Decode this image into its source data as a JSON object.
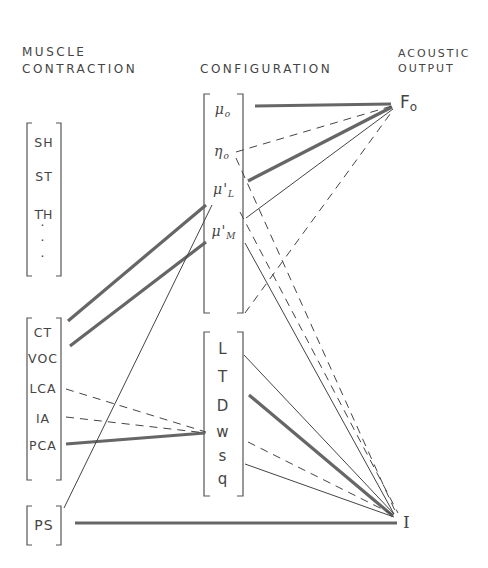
{
  "headers": {
    "muscle": [
      "MUSCLE",
      "CONTRACTION"
    ],
    "config": "CONFIGURATION",
    "acoustic": [
      "ACOUSTIC",
      "OUTPUT"
    ]
  },
  "muscle_group_1": [
    "SH",
    "ST",
    "TH",
    "·",
    "·",
    "·",
    "·"
  ],
  "muscle_group_2": [
    "CT",
    "VOC",
    "LCA",
    "IA",
    "PCA"
  ],
  "muscle_group_3": [
    "PS"
  ],
  "config_group_1": {
    "mu0": "μ",
    "mu0_sub": "o",
    "eta0": "η",
    "eta0_sub": "o",
    "muL": "μ'",
    "muL_sub": "L",
    "muM": "μ'",
    "muM_sub": "M"
  },
  "config_group_2": [
    "L",
    "T",
    "D",
    "w",
    "s",
    "q"
  ],
  "outputs": {
    "f0": "F",
    "f0_sub": "o",
    "intensity": "I"
  },
  "connections": [
    {
      "from": "CT",
      "to": "μ'L",
      "style": "double"
    },
    {
      "from": "VOC",
      "to": "μ'M",
      "style": "double"
    },
    {
      "from": "LCA",
      "to": "w",
      "style": "dashed"
    },
    {
      "from": "IA",
      "to": "w",
      "style": "dashed"
    },
    {
      "from": "PCA",
      "to": "w",
      "style": "double"
    },
    {
      "from": "PS",
      "to": "μ'L",
      "style": "solid"
    },
    {
      "from": "PS",
      "to": "I",
      "style": "double"
    },
    {
      "from": "μo",
      "to": "Fo",
      "style": "double"
    },
    {
      "from": "ηo",
      "to": "Fo",
      "style": "dashed"
    },
    {
      "from": "μ'L",
      "to": "Fo",
      "style": "double"
    },
    {
      "from": "μ'M",
      "to": "Fo",
      "style": "solid"
    },
    {
      "from": "L",
      "to": "Fo",
      "style": "dashed"
    },
    {
      "from": "ηo",
      "to": "I",
      "style": "dashed"
    },
    {
      "from": "μ'L",
      "to": "I",
      "style": "dashed"
    },
    {
      "from": "μ'M",
      "to": "I",
      "style": "solid"
    },
    {
      "from": "L",
      "to": "I",
      "style": "solid"
    },
    {
      "from": "D",
      "to": "I",
      "style": "double"
    },
    {
      "from": "s",
      "to": "I",
      "style": "dashed"
    },
    {
      "from": "q",
      "to": "I",
      "style": "solid"
    }
  ]
}
